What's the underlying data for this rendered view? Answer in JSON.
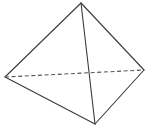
{
  "figure": {
    "background_color": "#ffffff",
    "width": 146,
    "height": 128,
    "stroke_color": "#3a3a3a",
    "hidden_stroke_color": "#555555",
    "stroke_width": 1.1,
    "hidden_stroke_width": 1.1,
    "hidden_dash_pattern": "4 2.6",
    "vertices": {
      "apex": {
        "label": "apex",
        "x": 81,
        "y": 3
      },
      "left": {
        "label": "left",
        "x": 5,
        "y": 77
      },
      "right": {
        "label": "right",
        "x": 144,
        "y": 70
      },
      "bottom": {
        "label": "bottom",
        "x": 95,
        "y": 124
      }
    },
    "edges": [
      {
        "name": "apex-left",
        "from": "apex",
        "to": "left",
        "style": "solid",
        "path": "M 81 3 L 5 77"
      },
      {
        "name": "apex-right",
        "from": "apex",
        "to": "right",
        "style": "solid",
        "path": "M 81 3 L 144 70"
      },
      {
        "name": "apex-bottom",
        "from": "apex",
        "to": "bottom",
        "style": "solid",
        "path": "M 81 3 L 95 124"
      },
      {
        "name": "left-bottom",
        "from": "left",
        "to": "bottom",
        "style": "solid",
        "path": "M 5 77 L 95 124"
      },
      {
        "name": "right-bottom",
        "from": "right",
        "to": "bottom",
        "style": "solid",
        "path": "M 144 70 L 95 124"
      },
      {
        "name": "left-right-hidden",
        "from": "left",
        "to": "right",
        "style": "dashed",
        "path": "M 5 77 L 144 70"
      }
    ]
  }
}
